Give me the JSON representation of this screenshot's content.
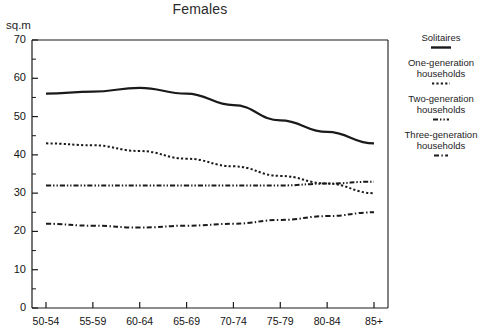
{
  "chart_data": {
    "type": "line",
    "title": "Females",
    "xlabel": "",
    "ylabel": "sq.m",
    "ylim": [
      0,
      70
    ],
    "ytick_step": 10,
    "yminor_step": 5,
    "grid": false,
    "legend_position": "right",
    "categories": [
      "50-54",
      "55-59",
      "60-64",
      "65-69",
      "70-74",
      "75-79",
      "80-84",
      "85+"
    ],
    "series": [
      {
        "name": "Solitaires",
        "style": "solid",
        "color": "#1a1a1a",
        "values": [
          56,
          56.5,
          57.5,
          56,
          53,
          49,
          46,
          43
        ]
      },
      {
        "name": "One-generation households",
        "style": "dotted",
        "color": "#1a1a1a",
        "values": [
          43,
          42.5,
          41,
          39,
          37,
          34.5,
          32.5,
          30
        ]
      },
      {
        "name": "Two-generation households",
        "style": "dash-dot-dot",
        "color": "#1a1a1a",
        "values": [
          32,
          32,
          32,
          32,
          32,
          32,
          32.5,
          33
        ]
      },
      {
        "name": "Three-generation households",
        "style": "dash-dot",
        "color": "#1a1a1a",
        "values": [
          22,
          21.5,
          21,
          21.5,
          22,
          23,
          24,
          25
        ]
      }
    ],
    "ytick_labels": [
      "70",
      "60",
      "50",
      "40",
      "30",
      "20",
      "10",
      "0"
    ]
  },
  "axis": {
    "unit": "sq.m",
    "y_labels": [
      "70",
      "60",
      "50",
      "40",
      "30",
      "20",
      "10",
      "0"
    ],
    "x_labels": [
      "50-54",
      "55-59",
      "60-64",
      "65-69",
      "70-74",
      "75-79",
      "80-84",
      "85+"
    ]
  },
  "legend": {
    "entries": [
      {
        "label": "Solitaires",
        "swatch": "solid-line-swatch"
      },
      {
        "label": "One-generation households",
        "swatch": "dotted-line-swatch"
      },
      {
        "label": "Two-generation households",
        "swatch": "dash-dot-dot-line-swatch"
      },
      {
        "label": "Three-generation households",
        "swatch": "dash-dot-line-swatch"
      }
    ]
  },
  "title": "Females"
}
